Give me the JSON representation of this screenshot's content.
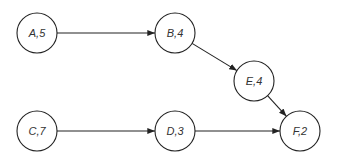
{
  "diagram": {
    "type": "activity-network",
    "stroke_color": "#222222",
    "nodes": [
      {
        "id": "A",
        "label": "A,5",
        "cx": 37,
        "cy": 33
      },
      {
        "id": "B",
        "label": "B,4",
        "cx": 175,
        "cy": 33
      },
      {
        "id": "E",
        "label": "E,4",
        "cx": 254,
        "cy": 81
      },
      {
        "id": "C",
        "label": "C,7",
        "cx": 37,
        "cy": 131
      },
      {
        "id": "D",
        "label": "D,3",
        "cx": 175,
        "cy": 131
      },
      {
        "id": "F",
        "label": "F,2",
        "cx": 300,
        "cy": 131
      }
    ],
    "edges": [
      {
        "from": "A",
        "to": "B"
      },
      {
        "from": "B",
        "to": "E"
      },
      {
        "from": "E",
        "to": "F"
      },
      {
        "from": "C",
        "to": "D"
      },
      {
        "from": "D",
        "to": "F"
      }
    ]
  }
}
